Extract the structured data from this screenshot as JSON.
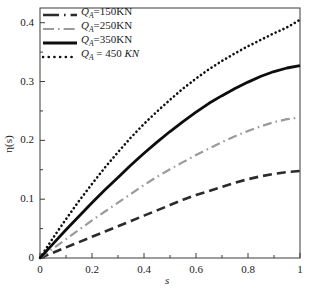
{
  "chart_data": {
    "type": "line",
    "title": "",
    "xlabel": "s",
    "ylabel": "η(s)",
    "xlim": [
      0,
      1
    ],
    "ylim": [
      0,
      0.425
    ],
    "grid": false,
    "legend_position": "top-left-inside",
    "x_ticks": [
      "0",
      "0.2",
      "0.4",
      "0.6",
      "0.8",
      "1"
    ],
    "x_tick_values": [
      0,
      0.2,
      0.4,
      0.6,
      0.8,
      1
    ],
    "y_ticks": [
      "0",
      "0.1",
      "0.2",
      "0.3",
      "0.4"
    ],
    "y_tick_values": [
      0,
      0.1,
      0.2,
      0.3,
      0.4
    ],
    "x": [
      0,
      0.05,
      0.1,
      0.15,
      0.2,
      0.25,
      0.3,
      0.35,
      0.4,
      0.45,
      0.5,
      0.55,
      0.6,
      0.65,
      0.7,
      0.75,
      0.8,
      0.85,
      0.9,
      0.95,
      1
    ],
    "series": [
      {
        "name": "Q_A=150KN",
        "label_prefix": "Q",
        "label_sub": "A",
        "label_suffix": "=150KN",
        "style": "dashed",
        "color": "#2b2b2b",
        "width": 2.6,
        "values": [
          0,
          0.009,
          0.018,
          0.027,
          0.036,
          0.045,
          0.054,
          0.063,
          0.072,
          0.081,
          0.09,
          0.099,
          0.107,
          0.114,
          0.121,
          0.128,
          0.134,
          0.139,
          0.143,
          0.146,
          0.148
        ]
      },
      {
        "name": "Q_A=250KN",
        "label_prefix": "Q",
        "label_sub": "A",
        "label_suffix": "=250KN",
        "style": "dash-dot",
        "color": "#9a9a9a",
        "width": 2.2,
        "values": [
          0,
          0.016,
          0.032,
          0.048,
          0.064,
          0.079,
          0.094,
          0.109,
          0.124,
          0.138,
          0.151,
          0.163,
          0.175,
          0.186,
          0.197,
          0.207,
          0.216,
          0.224,
          0.231,
          0.236,
          0.239
        ]
      },
      {
        "name": "Q_A=350KN",
        "label_prefix": "Q",
        "label_sub": "A",
        "label_suffix": "=350KN",
        "style": "solid",
        "color": "#0d0d0d",
        "width": 2.8,
        "values": [
          0,
          0.024,
          0.048,
          0.071,
          0.094,
          0.116,
          0.137,
          0.158,
          0.178,
          0.197,
          0.215,
          0.232,
          0.248,
          0.263,
          0.276,
          0.288,
          0.299,
          0.309,
          0.317,
          0.323,
          0.327
        ]
      },
      {
        "name": "Q_A = 450 KN",
        "label_prefix": "Q",
        "label_sub": "A",
        "label_suffix": " = 450 ",
        "label_unit": "KN",
        "style": "dotted",
        "color": "#111111",
        "width": 2.6,
        "values": [
          0,
          0.034,
          0.066,
          0.097,
          0.126,
          0.154,
          0.18,
          0.205,
          0.228,
          0.249,
          0.269,
          0.288,
          0.305,
          0.321,
          0.335,
          0.348,
          0.36,
          0.371,
          0.382,
          0.392,
          0.405
        ]
      }
    ]
  },
  "axes": {
    "x_title": "s",
    "y_title": "η(s)"
  }
}
